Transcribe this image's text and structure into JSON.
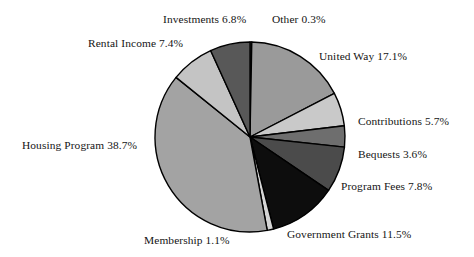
{
  "chart_data": {
    "type": "pie",
    "title": "",
    "subtitle": "",
    "xlabel": "",
    "ylabel": "",
    "units": "percent",
    "legend": "none",
    "grid": false,
    "labels_inline": true,
    "start_angle_deg": 0,
    "direction": "clockwise",
    "center_px": [
      250,
      137
    ],
    "radius_px": 95,
    "categories": [
      "Other",
      "United Way",
      "Contributions",
      "Bequests",
      "Program Fees",
      "Government Grants",
      "Membership",
      "Housing Program",
      "Rental Income",
      "Investments"
    ],
    "values": [
      0.3,
      17.1,
      5.7,
      3.6,
      7.8,
      11.5,
      1.1,
      38.7,
      7.4,
      6.8
    ],
    "total": 100.0,
    "slices": [
      {
        "name": "Other",
        "value": 0.3,
        "label": "Other 0.3%",
        "color": "#5a5a5a"
      },
      {
        "name": "United Way",
        "value": 17.1,
        "label": "United Way 17.1%",
        "color": "#9a9a9a"
      },
      {
        "name": "Contributions",
        "value": 5.7,
        "label": "Contributions 5.7%",
        "color": "#c9c9c9"
      },
      {
        "name": "Bequests",
        "value": 3.6,
        "label": "Bequests 3.6%",
        "color": "#6e6e6e"
      },
      {
        "name": "Program Fees",
        "value": 7.8,
        "label": "Program Fees 7.8%",
        "color": "#4b4b4b"
      },
      {
        "name": "Government Grants",
        "value": 11.5,
        "label": "Government Grants 11.5%",
        "color": "#0d0d0d"
      },
      {
        "name": "Membership",
        "value": 1.1,
        "label": "Membership 1.1%",
        "color": "#d6d6d6"
      },
      {
        "name": "Housing Program",
        "value": 38.7,
        "label": "Housing Program 38.7%",
        "color": "#a3a3a3"
      },
      {
        "name": "Rental Income",
        "value": 7.4,
        "label": "Rental Income 7.4%",
        "color": "#c4c4c4"
      },
      {
        "name": "Investments",
        "value": 6.8,
        "label": "Investments 6.8%",
        "color": "#585858"
      }
    ],
    "outline_color": "#000000",
    "background_color": "#ffffff"
  },
  "labels": {
    "investments": "Investments 6.8%",
    "other": "Other 0.3%",
    "rental_income": "Rental Income 7.4%",
    "united_way": "United Way 17.1%",
    "contributions": "Contributions 5.7%",
    "bequests": "Bequests 3.6%",
    "program_fees": "Program Fees 7.8%",
    "housing_program": "Housing Program 38.7%",
    "government_grants": "Government Grants 11.5%",
    "membership": "Membership 1.1%"
  }
}
